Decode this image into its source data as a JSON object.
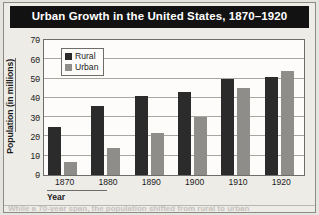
{
  "figure": {
    "title": "Urban Growth in the United States, 1870–1920"
  },
  "legend": {
    "items": [
      {
        "label": "Rural",
        "color": "#2b2b2b"
      },
      {
        "label": "Urban",
        "color": "#8f8d89"
      }
    ]
  },
  "axes": {
    "ylabel": "Population (in millions)",
    "xlabel": "Year",
    "yticks": [
      "70",
      "60",
      "50",
      "40",
      "30",
      "20",
      "10",
      "0"
    ],
    "xticks": [
      "1870",
      "1880",
      "1890",
      "1900",
      "1910",
      "1920"
    ]
  },
  "caption": {
    "text": "While a 70-year span, the population shifted from rural to urban"
  },
  "chart_data": {
    "type": "bar",
    "title": "Urban Growth in the United States, 1870–1920",
    "xlabel": "Year",
    "ylabel": "Population (in millions)",
    "categories": [
      "1870",
      "1880",
      "1890",
      "1900",
      "1910",
      "1920"
    ],
    "series": [
      {
        "name": "Rural",
        "color": "#2b2b2b",
        "values": [
          25,
          36,
          41,
          43,
          50,
          51
        ]
      },
      {
        "name": "Urban",
        "color": "#8f8d89",
        "values": [
          7,
          14,
          22,
          30,
          45,
          54
        ]
      }
    ],
    "ylim": [
      0,
      70
    ],
    "ytick_step": 10,
    "grid": true,
    "legend_position": "top-left"
  }
}
